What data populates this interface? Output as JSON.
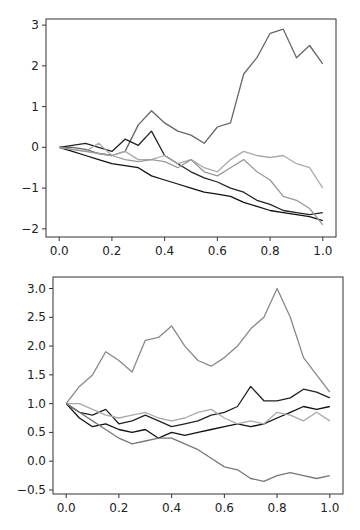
{
  "chart_data": [
    {
      "type": "line",
      "title": "",
      "xlabel": "",
      "ylabel": "",
      "xlim": [
        -0.05,
        1.05
      ],
      "ylim": [
        -2.2,
        3.15
      ],
      "grid": false,
      "xticks": [
        0.0,
        0.2,
        0.4,
        0.6,
        0.8,
        1.0
      ],
      "xtick_labels": [
        "0.0",
        "0.2",
        "0.4",
        "0.6",
        "0.8",
        "1.0"
      ],
      "yticks": [
        3,
        2,
        1,
        0,
        -1,
        -2
      ],
      "ytick_labels": [
        "3",
        "2",
        "1",
        "0",
        "−1",
        "−2"
      ],
      "x": [
        0,
        0.05,
        0.1,
        0.15,
        0.2,
        0.25,
        0.3,
        0.35,
        0.4,
        0.45,
        0.5,
        0.55,
        0.6,
        0.65,
        0.7,
        0.75,
        0.8,
        0.85,
        0.9,
        0.95,
        1.0
      ],
      "series": [
        {
          "name": "path-1",
          "color": "#666666",
          "values": [
            0,
            0,
            -0.05,
            -0.15,
            -0.2,
            -0.1,
            0.55,
            0.9,
            0.6,
            0.4,
            0.3,
            0.1,
            0.5,
            0.6,
            1.8,
            2.2,
            2.8,
            2.9,
            2.2,
            2.5,
            2.05
          ]
        },
        {
          "name": "path-2",
          "color": "#222222",
          "values": [
            0,
            0.05,
            0.1,
            0.0,
            -0.1,
            0.2,
            0.05,
            0.4,
            -0.2,
            -0.4,
            -0.6,
            -0.75,
            -0.85,
            -1.0,
            -1.1,
            -1.3,
            -1.4,
            -1.55,
            -1.6,
            -1.65,
            -1.6
          ]
        },
        {
          "name": "path-3",
          "color": "#111111",
          "values": [
            0,
            -0.1,
            -0.2,
            -0.3,
            -0.4,
            -0.45,
            -0.5,
            -0.7,
            -0.8,
            -0.9,
            -1.0,
            -1.1,
            -1.15,
            -1.2,
            -1.35,
            -1.45,
            -1.55,
            -1.6,
            -1.65,
            -1.7,
            -1.8
          ]
        },
        {
          "name": "path-4",
          "color": "#aaaaaa",
          "values": [
            0,
            -0.05,
            -0.1,
            0.1,
            -0.2,
            -0.1,
            -0.3,
            -0.3,
            -0.2,
            -0.4,
            -0.3,
            -0.5,
            -0.6,
            -0.3,
            -0.1,
            -0.2,
            -0.25,
            -0.2,
            -0.4,
            -0.5,
            -1.0
          ]
        },
        {
          "name": "path-5",
          "color": "#999999",
          "values": [
            0,
            -0.05,
            -0.1,
            -0.15,
            -0.2,
            -0.3,
            -0.35,
            -0.3,
            -0.35,
            -0.5,
            -0.3,
            -0.6,
            -0.7,
            -0.5,
            -0.3,
            -0.6,
            -0.8,
            -1.2,
            -1.3,
            -1.5,
            -1.9
          ]
        }
      ]
    },
    {
      "type": "line",
      "title": "",
      "xlabel": "",
      "ylabel": "",
      "xlim": [
        -0.05,
        1.05
      ],
      "ylim": [
        -0.57,
        3.2
      ],
      "grid": false,
      "xticks": [
        0.0,
        0.2,
        0.4,
        0.6,
        0.8,
        1.0
      ],
      "xtick_labels": [
        "0.0",
        "0.2",
        "0.4",
        "0.6",
        "0.8",
        "1.0"
      ],
      "yticks": [
        3.0,
        2.5,
        2.0,
        1.5,
        1.0,
        0.5,
        0.0,
        -0.5
      ],
      "ytick_labels": [
        "3.0",
        "2.5",
        "2.0",
        "1.5",
        "1.0",
        "0.5",
        "0.0",
        "−0.5"
      ],
      "x": [
        0,
        0.05,
        0.1,
        0.15,
        0.2,
        0.25,
        0.3,
        0.35,
        0.4,
        0.45,
        0.5,
        0.55,
        0.6,
        0.65,
        0.7,
        0.75,
        0.8,
        0.85,
        0.9,
        0.95,
        1.0
      ],
      "series": [
        {
          "name": "path-1",
          "color": "#888888",
          "values": [
            1.0,
            1.3,
            1.5,
            1.9,
            1.75,
            1.55,
            2.1,
            2.15,
            2.35,
            2.0,
            1.75,
            1.65,
            1.8,
            2.0,
            2.3,
            2.5,
            3.0,
            2.5,
            1.8,
            1.5,
            1.2
          ]
        },
        {
          "name": "path-2",
          "color": "#222222",
          "values": [
            1.0,
            0.85,
            0.8,
            0.9,
            0.65,
            0.7,
            0.8,
            0.7,
            0.6,
            0.65,
            0.7,
            0.8,
            0.85,
            0.95,
            1.3,
            1.05,
            1.05,
            1.1,
            1.25,
            1.2,
            1.1
          ]
        },
        {
          "name": "path-3",
          "color": "#111111",
          "values": [
            1.0,
            0.75,
            0.6,
            0.65,
            0.55,
            0.5,
            0.55,
            0.4,
            0.5,
            0.45,
            0.5,
            0.55,
            0.6,
            0.65,
            0.6,
            0.65,
            0.75,
            0.85,
            0.95,
            0.9,
            0.95
          ]
        },
        {
          "name": "path-4",
          "color": "#aaaaaa",
          "values": [
            1.0,
            1.0,
            0.9,
            0.8,
            0.75,
            0.8,
            0.85,
            0.75,
            0.7,
            0.75,
            0.85,
            0.9,
            0.75,
            0.65,
            0.7,
            0.65,
            0.85,
            0.8,
            0.7,
            0.85,
            0.7
          ]
        },
        {
          "name": "path-5",
          "color": "#777777",
          "values": [
            1.0,
            0.85,
            0.7,
            0.55,
            0.4,
            0.3,
            0.35,
            0.4,
            0.4,
            0.3,
            0.2,
            0.05,
            -0.1,
            -0.15,
            -0.3,
            -0.35,
            -0.25,
            -0.2,
            -0.25,
            -0.3,
            -0.25
          ]
        }
      ]
    }
  ]
}
